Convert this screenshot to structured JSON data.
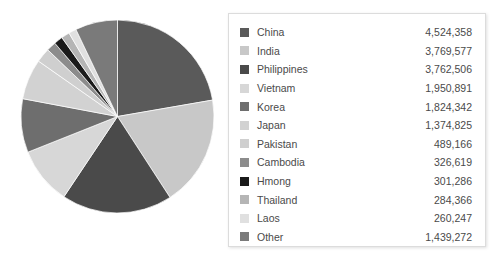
{
  "chart_data": {
    "type": "pie",
    "title": "",
    "legend_position": "right",
    "categories": [
      "China",
      "India",
      "Philippines",
      "Vietnam",
      "Korea",
      "Japan",
      "Pakistan",
      "Cambodia",
      "Hmong",
      "Thailand",
      "Laos",
      "Other"
    ],
    "values": [
      4524358,
      3769577,
      3762506,
      1950891,
      1824342,
      1374825,
      489166,
      326619,
      301286,
      284366,
      260247,
      1439272
    ],
    "value_labels": [
      "4,524,358",
      "3,769,577",
      "3,762,506",
      "1,950,891",
      "1,824,342",
      "1,374,825",
      "489,166",
      "326,619",
      "301,286",
      "284,366",
      "260,247",
      "1,439,272"
    ],
    "colors": [
      "#5a5a5a",
      "#c8c8c8",
      "#4a4a4a",
      "#d7d7d7",
      "#6e6e6e",
      "#d2d2d2",
      "#cfcfcf",
      "#8c8c8c",
      "#1a1a1a",
      "#b5b5b5",
      "#e0e0e0",
      "#7a7a7a"
    ],
    "total": 20307279,
    "start_angle_deg": 0,
    "direction": "clockwise"
  },
  "legend": {
    "rows": [
      {
        "label": "China",
        "value": "4,524,358",
        "color": "#5a5a5a"
      },
      {
        "label": "India",
        "value": "3,769,577",
        "color": "#c8c8c8"
      },
      {
        "label": "Philippines",
        "value": "3,762,506",
        "color": "#4a4a4a"
      },
      {
        "label": "Vietnam",
        "value": "1,950,891",
        "color": "#d7d7d7"
      },
      {
        "label": "Korea",
        "value": "1,824,342",
        "color": "#6e6e6e"
      },
      {
        "label": "Japan",
        "value": "1,374,825",
        "color": "#d2d2d2"
      },
      {
        "label": "Pakistan",
        "value": "489,166",
        "color": "#cfcfcf"
      },
      {
        "label": "Cambodia",
        "value": "326,619",
        "color": "#8c8c8c"
      },
      {
        "label": "Hmong",
        "value": "301,286",
        "color": "#1a1a1a"
      },
      {
        "label": "Thailand",
        "value": "284,366",
        "color": "#b5b5b5"
      },
      {
        "label": "Laos",
        "value": "260,247",
        "color": "#e0e0e0"
      },
      {
        "label": "Other",
        "value": "1,439,272",
        "color": "#7a7a7a"
      }
    ]
  }
}
